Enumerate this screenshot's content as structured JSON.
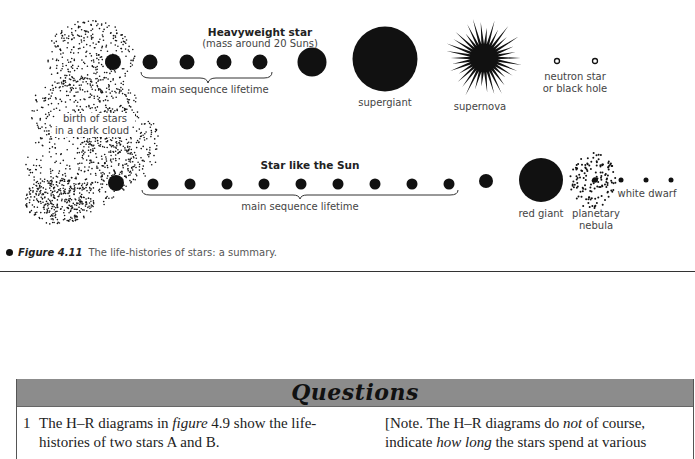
{
  "diagram": {
    "heavyweight": {
      "title": "Heavyweight star",
      "subtitle": "(mass around 20 Suns)",
      "main_sequence_label": "main sequence lifetime",
      "stage_labels": {
        "supergiant": "supergiant",
        "supernova": "supernova",
        "remnant_line1": "neutron star",
        "remnant_line2": "or black hole"
      }
    },
    "cloud_label": {
      "line1": "birth of stars",
      "line2": "in a dark cloud"
    },
    "sunlike": {
      "title": "Star like the Sun",
      "main_sequence_label": "main sequence lifetime",
      "stage_labels": {
        "red_giant": "red giant",
        "nebula_line1": "planetary",
        "nebula_line2": "nebula",
        "white_dwarf": "white dwarf"
      }
    }
  },
  "caption": {
    "figure_number": "Figure 4.11",
    "text": "The life-histories of stars: a summary."
  },
  "questions": {
    "heading": "Questions",
    "q1": {
      "number": "1",
      "line1": "The H–R diagrams in",
      "ref": "figure",
      "line1_end": "4.9 show the life-",
      "line2": "histories of two stars A and B."
    },
    "note": {
      "line1_start": "[Note. The H–R diagrams do",
      "line1_em": "not",
      "line1_end": "of course,",
      "line2_start": "indicate",
      "line2_em": "how long",
      "line2_end": "the stars spend at various"
    }
  }
}
